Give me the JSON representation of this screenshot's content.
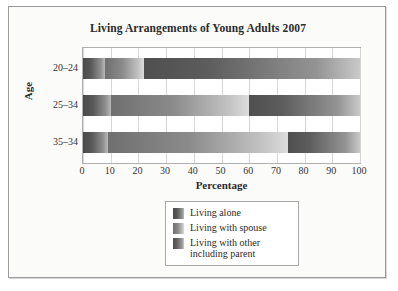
{
  "chart_data": {
    "type": "bar",
    "orientation": "horizontal",
    "stacked": true,
    "title": "Living Arrangements of Young Adults 2007",
    "xlabel": "Percentage",
    "ylabel": "Age",
    "xlim": [
      0,
      100
    ],
    "grid": true,
    "legend_position": "below-center",
    "categories": [
      "20–24",
      "25–34",
      "35–34"
    ],
    "xticks": [
      "0",
      "10",
      "20",
      "30",
      "40",
      "50",
      "60",
      "70",
      "80",
      "90",
      "100"
    ],
    "xtick_values": [
      0,
      10,
      20,
      30,
      40,
      50,
      60,
      70,
      80,
      90,
      100
    ],
    "series": [
      {
        "name": "Living alone",
        "color": "#4a4a4a",
        "values": [
          8,
          10,
          9
        ]
      },
      {
        "name": "Living with spouse",
        "color": "#8b8b8b",
        "values": [
          14,
          50,
          65
        ]
      },
      {
        "name": "Living with other including parent",
        "color": "#4f4f4f",
        "values": [
          78,
          40,
          26
        ]
      }
    ],
    "segments": [
      {
        "category": "20–24",
        "parts": [
          {
            "series": "Living alone",
            "start": 0,
            "end": 8
          },
          {
            "series": "Living with spouse",
            "start": 8,
            "end": 22
          },
          {
            "series": "Living with other including parent",
            "start": 22,
            "end": 100
          }
        ]
      },
      {
        "category": "25–34",
        "parts": [
          {
            "series": "Living alone",
            "start": 0,
            "end": 10
          },
          {
            "series": "Living with spouse",
            "start": 10,
            "end": 60
          },
          {
            "series": "Living with other including parent",
            "start": 60,
            "end": 100
          }
        ]
      },
      {
        "category": "35–34",
        "parts": [
          {
            "series": "Living alone",
            "start": 0,
            "end": 9
          },
          {
            "series": "Living with spouse",
            "start": 9,
            "end": 74
          },
          {
            "series": "Living with other including parent",
            "start": 74,
            "end": 100
          }
        ]
      }
    ]
  },
  "legend": {
    "items": [
      {
        "label": "Living alone",
        "swatch": "legend-swatch-alone"
      },
      {
        "label": "Living with spouse",
        "swatch": "legend-swatch-spouse"
      },
      {
        "label": "Living with other\nincluding parent",
        "swatch": "legend-swatch-other"
      }
    ]
  },
  "legend_lines": {
    "item3_line1": "Living with other",
    "item3_line2": "including parent"
  },
  "colors": {
    "frame_border": "#9b9b9b",
    "plot_border": "#b0b0b0",
    "gridline": "#d6d6d6",
    "page_background": "#fbfbfa",
    "plot_background": "#ffffff",
    "text": "#2b2b2b"
  }
}
